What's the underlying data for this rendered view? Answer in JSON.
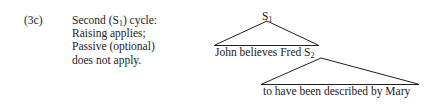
{
  "figure": {
    "example_number": "(3c)",
    "description_lines": [
      "Second (S₁) cycle:",
      "Raising applies;",
      "Passive (optional)",
      "does not apply."
    ],
    "description_line_1_pre": "Second (S",
    "description_line_1_sub": "1",
    "description_line_1_post": ") cycle:",
    "description_line_2": "Raising applies;",
    "description_line_3": "Passive (optional)",
    "description_line_4": "does not apply."
  },
  "tree": {
    "root_node_label_text": "S",
    "root_node_label_sub": "1",
    "embedded_node_label_text": "S",
    "embedded_node_label_sub": "2",
    "upper_terminal_string": "John believes Fred ",
    "lower_terminal_string": "to have been described by Mary",
    "line_color": "#1f1f1f",
    "triangles": [
      {
        "name": "S1-triangle",
        "apex": [
          267,
          21
        ],
        "base_left": [
          215,
          45
        ],
        "base_right": [
          318,
          45
        ]
      },
      {
        "name": "S2-triangle",
        "apex": [
          321,
          58
        ],
        "base_left": [
          262,
          84
        ],
        "base_right": [
          418,
          84
        ]
      }
    ]
  },
  "colors": {
    "background": "#ffffff",
    "text": "#1a1a1a",
    "rule": "#1f1f1f"
  }
}
